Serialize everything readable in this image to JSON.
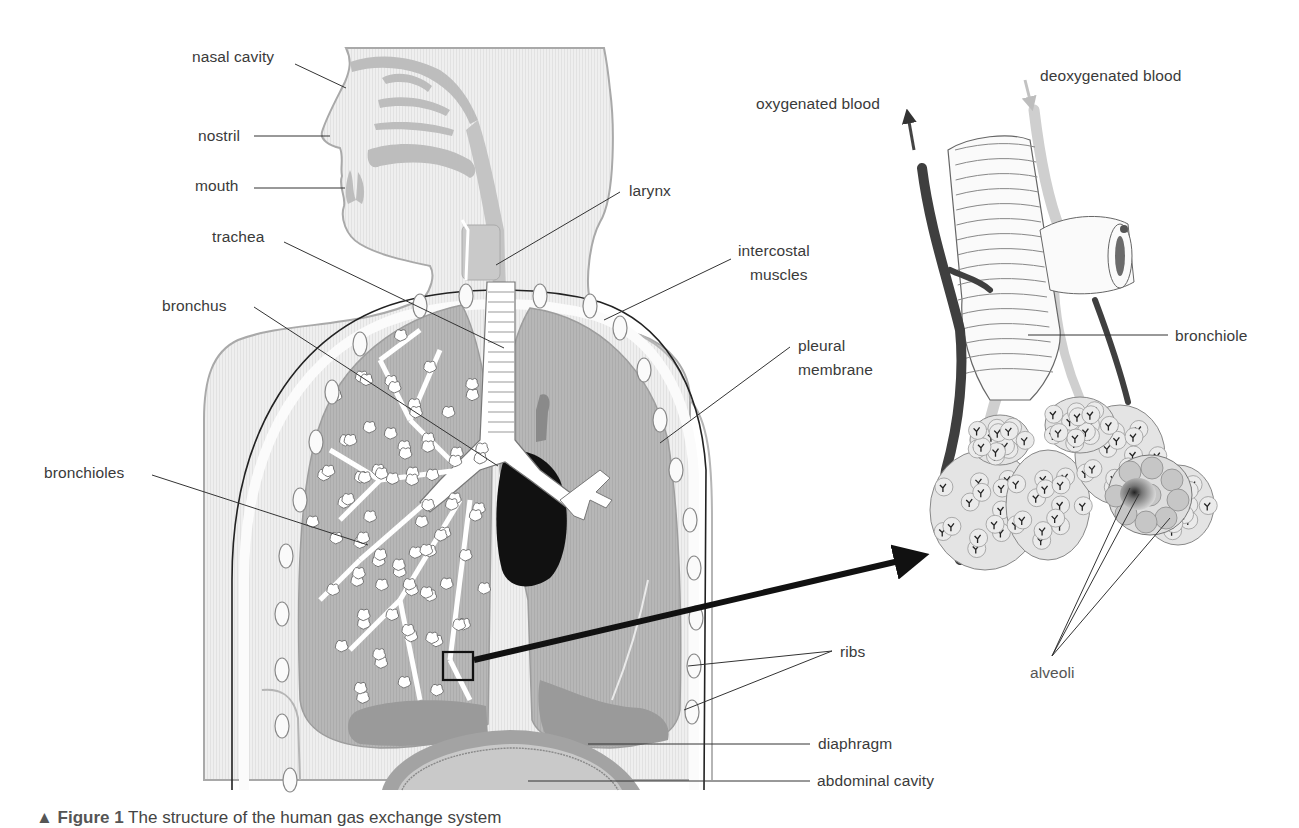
{
  "figure": {
    "title": "Structure of the human gas exchange system",
    "caption_prefix": "▲ Figure 1",
    "caption_text": "The structure of the human gas exchange system",
    "colors": {
      "body_fill": "#ececec",
      "body_outline": "#a9a9a9",
      "lung_fill": "#b3b3b3",
      "lung_lower": "#9c9c9c",
      "airway": "#ffffff",
      "heart": "#111111",
      "label_text": "#3a3a3a",
      "leader_line": "#333333",
      "oxygenated_vessel": "#555555",
      "deoxygenated_vessel": "#c8c8c8"
    }
  },
  "labels": {
    "nasal_cavity": "nasal cavity",
    "nostril": "nostril",
    "mouth": "mouth",
    "trachea": "trachea",
    "larynx": "larynx",
    "bronchus": "bronchus",
    "intercostal_muscles_1": "intercostal",
    "intercostal_muscles_2": "muscles",
    "pleural_membrane_1": "pleural",
    "pleural_membrane_2": "membrane",
    "bronchioles": "bronchioles",
    "ribs": "ribs",
    "diaphragm": "diaphragm",
    "abdominal_cavity": "abdominal cavity",
    "oxygenated_blood": "oxygenated blood",
    "deoxygenated_blood": "deoxygenated blood",
    "bronchiole": "bronchiole",
    "alveoli": "alveoli"
  }
}
